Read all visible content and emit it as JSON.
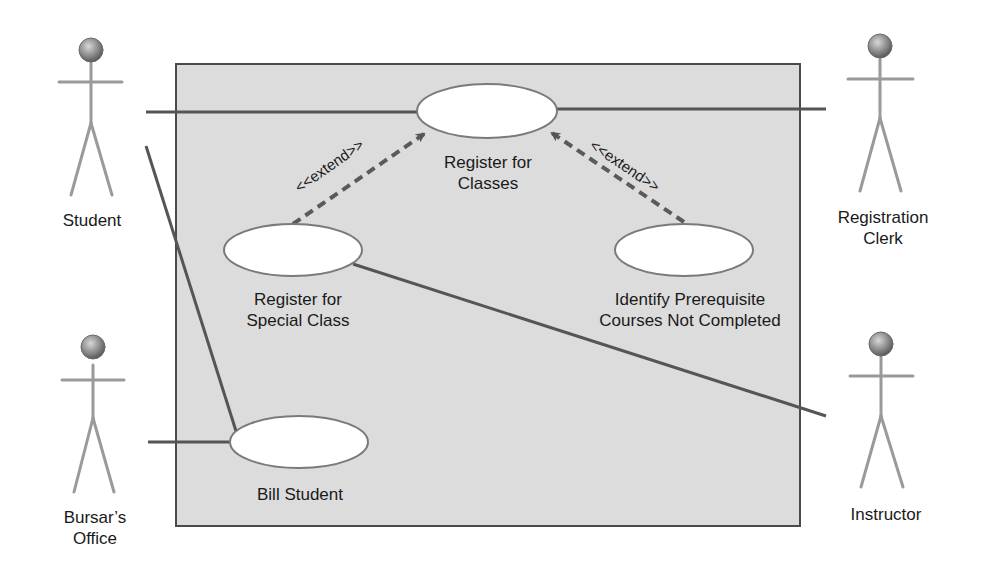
{
  "diagram": {
    "type": "UML use case diagram",
    "colors": {
      "background": "#ffffff",
      "boundary_fill": "#dcdcdc",
      "boundary_stroke": "#4a4a4a",
      "association": "#555555",
      "extend": "#5a5a5a",
      "usecase_fill": "#ffffff",
      "usecase_stroke": "#7a7a7a",
      "actor_head": "#8a8a8a",
      "actor_body": "#9a9a9a"
    },
    "actors": [
      {
        "id": "student",
        "label": "Student"
      },
      {
        "id": "registration-clerk",
        "label": "Registration\nClerk",
        "line1": "Registration",
        "line2": "Clerk"
      },
      {
        "id": "bursars-office",
        "label": "Bursar's Office",
        "line1": "Bursar’s",
        "line2": "Office"
      },
      {
        "id": "instructor",
        "label": "Instructor"
      }
    ],
    "use_cases": [
      {
        "id": "register-for-classes",
        "line1": "Register for",
        "line2": "Classes"
      },
      {
        "id": "register-for-special-class",
        "line1": "Register for",
        "line2": "Special Class"
      },
      {
        "id": "identify-prerequisite",
        "line1": "Identify Prerequisite",
        "line2": "Courses Not Completed"
      },
      {
        "id": "bill-student",
        "line1": "Bill Student"
      }
    ],
    "relationships": [
      {
        "type": "association",
        "from": "Student",
        "to": "Register for Classes"
      },
      {
        "type": "association",
        "from": "Registration Clerk",
        "to": "Register for Classes"
      },
      {
        "type": "association",
        "from": "Student",
        "to": "Bill Student"
      },
      {
        "type": "association",
        "from": "Bursar's Office",
        "to": "Bill Student"
      },
      {
        "type": "association",
        "from": "Instructor",
        "to": "Register for Special Class"
      },
      {
        "type": "extend",
        "from": "Register for Special Class",
        "to": "Register for Classes",
        "label": "<<extend>>"
      },
      {
        "type": "extend",
        "from": "Identify Prerequisite Courses Not Completed",
        "to": "Register for Classes",
        "label": "<<extend>>"
      }
    ],
    "extend_label": "<<extend>>"
  }
}
